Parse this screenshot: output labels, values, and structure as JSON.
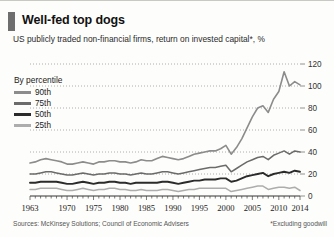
{
  "header": {
    "title": "Well-fed top dogs",
    "subtitle": "US publicly traded non-financial firms, return on invested capital*, %"
  },
  "legend": {
    "heading": "By percentile",
    "entries": [
      {
        "label": "90th",
        "color": "#8c8c8c"
      },
      {
        "label": "75th",
        "color": "#6b6b6b"
      },
      {
        "label": "50th",
        "color": "#2b2b2b"
      },
      {
        "label": "25th",
        "color": "#adadad"
      }
    ]
  },
  "footer": {
    "sources": "Sources: McKinsey Solutions; Council of Economic Advisers",
    "footnote": "*Excluding goodwill"
  },
  "chart_data": {
    "type": "line",
    "title": "Well-fed top dogs",
    "subtitle": "US publicly traded non-financial firms, return on invested capital*, %",
    "xlabel": "",
    "ylabel": "%",
    "ylim": [
      0,
      120
    ],
    "yticks": [
      0,
      20,
      40,
      60,
      80,
      100,
      120
    ],
    "ytick_labels": [
      "0",
      "20",
      "40",
      "60",
      "80",
      "100",
      "120"
    ],
    "y_axis_position": "right",
    "grid": true,
    "grid_style": "dotted",
    "legend_position": "upper-left",
    "xlim": [
      1963,
      2014
    ],
    "xticks": [
      1963,
      1970,
      1975,
      1980,
      1985,
      1990,
      1995,
      2000,
      2005,
      2010,
      2014
    ],
    "xtick_labels": [
      "1963",
      "1970",
      "1975",
      "1980",
      "1985",
      "1990",
      "1995",
      "2000",
      "2005",
      "2010",
      "2014"
    ],
    "x": [
      1963,
      1964,
      1965,
      1966,
      1967,
      1968,
      1969,
      1970,
      1971,
      1972,
      1973,
      1974,
      1975,
      1976,
      1977,
      1978,
      1979,
      1980,
      1981,
      1982,
      1983,
      1984,
      1985,
      1986,
      1987,
      1988,
      1989,
      1990,
      1991,
      1992,
      1993,
      1994,
      1995,
      1996,
      1997,
      1998,
      1999,
      2000,
      2001,
      2002,
      2003,
      2004,
      2005,
      2006,
      2007,
      2008,
      2009,
      2010,
      2011,
      2012,
      2013,
      2014
    ],
    "series": [
      {
        "name": "90th",
        "color": "#8c8c8c",
        "width": 1.6,
        "values": [
          30,
          31,
          33,
          34,
          33,
          32,
          31,
          29,
          29,
          30,
          31,
          30,
          29,
          31,
          31,
          32,
          32,
          31,
          31,
          30,
          31,
          33,
          32,
          32,
          34,
          36,
          35,
          34,
          33,
          34,
          36,
          38,
          39,
          40,
          41,
          41,
          43,
          46,
          38,
          44,
          52,
          62,
          72,
          80,
          82,
          76,
          88,
          95,
          113,
          100,
          104,
          101
        ]
      },
      {
        "name": "75th",
        "color": "#6b6b6b",
        "width": 1.5,
        "values": [
          20,
          20,
          21,
          22,
          22,
          21,
          20,
          19,
          19,
          20,
          21,
          20,
          19,
          20,
          20,
          21,
          21,
          20,
          20,
          19,
          20,
          21,
          20,
          20,
          21,
          22,
          22,
          21,
          20,
          21,
          22,
          23,
          24,
          25,
          26,
          26,
          27,
          28,
          22,
          25,
          28,
          31,
          33,
          35,
          36,
          33,
          37,
          39,
          41,
          38,
          41,
          40
        ]
      },
      {
        "name": "50th",
        "color": "#2b2b2b",
        "width": 1.9,
        "values": [
          12,
          12,
          13,
          13,
          13,
          13,
          12,
          11,
          11,
          12,
          13,
          12,
          11,
          12,
          12,
          13,
          13,
          12,
          12,
          11,
          12,
          12,
          12,
          12,
          12,
          13,
          13,
          12,
          11,
          12,
          13,
          14,
          14,
          15,
          15,
          15,
          16,
          16,
          13,
          14,
          16,
          18,
          19,
          20,
          21,
          18,
          20,
          21,
          22,
          21,
          23,
          22
        ]
      },
      {
        "name": "25th",
        "color": "#adadad",
        "width": 1.5,
        "values": [
          6,
          6,
          7,
          7,
          7,
          7,
          6,
          5,
          5,
          6,
          7,
          6,
          5,
          6,
          6,
          7,
          7,
          6,
          6,
          5,
          5,
          6,
          5,
          5,
          5,
          6,
          6,
          5,
          4,
          5,
          6,
          6,
          7,
          7,
          7,
          7,
          7,
          7,
          4,
          5,
          6,
          7,
          8,
          9,
          9,
          6,
          7,
          8,
          8,
          7,
          8,
          5
        ]
      }
    ]
  }
}
